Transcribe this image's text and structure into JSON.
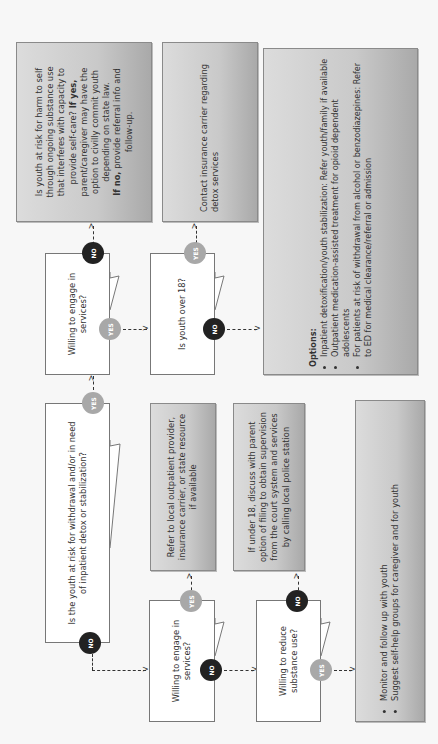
{
  "diagram": {
    "orientation": "rotated 90 degrees counter-clockwise",
    "boxes": {
      "harm_risk": {
        "line1": "Is youth at risk for harm to self",
        "line2": "through ongoing substance use",
        "line3": "that interferes with capacity to",
        "line4": "provide self-care?",
        "if_yes_label": "If yes,",
        "line5": "parent/caregiver may have the",
        "line6": "option to civilly commit youth",
        "line7": "depending on state law.",
        "if_no_label": "If no,",
        "line8": "provide referral info and",
        "line9": "follow-up."
      },
      "contact_insurance": {
        "text": "Contact insurance carrier regarding detox services"
      },
      "options": {
        "title": "Options:",
        "items": [
          "Inpatient detoxification/youth stabilization: Refer youth/family if available",
          "Outpatient medication-assisted treatment for opioid dependent adolescents",
          "For patients at risk of withdrawal from alcohol or benzodiazepines: Refer to ED for medical clearance/referral or admission"
        ]
      },
      "refer_outpatient": {
        "text": "Refer to local outpatient provider, insurance carrier, or state resource if available"
      },
      "under_18": {
        "text": "If under 18, discuss with parent option of filing to obtain supervision from the court system and services by calling local police station"
      },
      "monitor": {
        "items": [
          "Monitor and follow up with youth",
          "Suggest self-help groups for caregiver and for youth"
        ]
      }
    },
    "questions": {
      "withdrawal_risk": "Is the youth at risk for withdrawal and/or in need of inpatient detox or stabilization?",
      "willing_engage_top": "Willing to engage in services?",
      "youth_over_18": "Is youth over 18?",
      "willing_engage_bottom": "Willing to engage in services?",
      "willing_reduce": "Willing to reduce substance use?"
    },
    "badges": {
      "yes": "YES",
      "no": "NO"
    },
    "arrow_head": ">",
    "colors": {
      "yes_badge": "#a8a8a8",
      "no_badge": "#222222",
      "gray_box": "#c9c9c9",
      "question_box": "#ffffff"
    }
  }
}
